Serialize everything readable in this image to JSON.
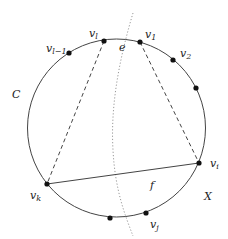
{
  "diagram": {
    "circle_label": "C",
    "region_label": "X",
    "edge_e_label": "e",
    "chord_f_label": "f",
    "vertices": [
      {
        "id": "v_l_minus_1",
        "base": "v",
        "sub": "l−1",
        "x": 69,
        "y": 53
      },
      {
        "id": "v_l",
        "base": "v",
        "sub": "l",
        "x": 104,
        "y": 41
      },
      {
        "id": "v_1",
        "base": "v",
        "sub": "1",
        "x": 140,
        "y": 42
      },
      {
        "id": "v_2",
        "base": "v",
        "sub": "2",
        "x": 173,
        "y": 60
      },
      {
        "id": "unlabeled_right",
        "base": "",
        "sub": "",
        "x": 196,
        "y": 88
      },
      {
        "id": "v_i",
        "base": "v",
        "sub": "i",
        "x": 199,
        "y": 163
      },
      {
        "id": "v_j",
        "base": "v",
        "sub": "j",
        "x": 146,
        "y": 213
      },
      {
        "id": "unlabeled_bottom",
        "base": "",
        "sub": "",
        "x": 110,
        "y": 218
      },
      {
        "id": "v_k",
        "base": "v",
        "sub": "k",
        "x": 47,
        "y": 184
      }
    ],
    "edges": [
      {
        "type": "solid",
        "from": "v_k",
        "to": "v_i",
        "label": "f"
      },
      {
        "type": "dashed",
        "from": "v_l",
        "to": "v_k"
      },
      {
        "type": "dashed",
        "from": "v_1",
        "to": "v_i"
      },
      {
        "type": "dotted-curve",
        "label": "e"
      }
    ],
    "colors": {
      "stroke": "#333333",
      "dot": "#111111",
      "dotted": "#888888"
    }
  }
}
